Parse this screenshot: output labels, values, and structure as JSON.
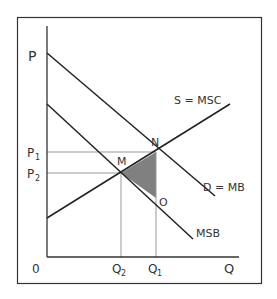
{
  "diagram": {
    "axes": {
      "y_label": "P",
      "x_label": "Q",
      "origin_label": "0"
    },
    "curves": [
      {
        "id": "demand",
        "label": "D = MB"
      },
      {
        "id": "supply",
        "label": "S = MSC"
      },
      {
        "id": "msb",
        "label": "MSB"
      }
    ],
    "points": [
      {
        "id": "N",
        "label": "N"
      },
      {
        "id": "M",
        "label": "M"
      },
      {
        "id": "O",
        "label": "O"
      }
    ],
    "price_levels": [
      {
        "id": "P1",
        "base": "P",
        "sub": "1"
      },
      {
        "id": "P2",
        "base": "P",
        "sub": "2"
      }
    ],
    "quantity_levels": [
      {
        "id": "Q2",
        "base": "Q",
        "sub": "2"
      },
      {
        "id": "Q1",
        "base": "Q",
        "sub": "1"
      }
    ],
    "shaded_area": {
      "description": "Triangle MNO (welfare loss)",
      "color": "#808080"
    },
    "colors": {
      "line": "#222222",
      "guide": "#999999",
      "frame": "#333333",
      "text": "#333333"
    }
  }
}
